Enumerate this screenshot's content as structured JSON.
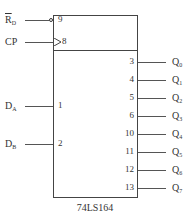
{
  "chip": {
    "name": "74LS164",
    "inputs": [
      {
        "signal": "R",
        "sub": "D",
        "overline": true,
        "pin": "9",
        "y": 20,
        "inverted": true
      },
      {
        "signal": "CP",
        "sub": "",
        "overline": false,
        "pin": "8",
        "y": 42,
        "clock": true
      },
      {
        "signal": "D",
        "sub": "A",
        "overline": false,
        "pin": "1",
        "y": 106
      },
      {
        "signal": "D",
        "sub": "B",
        "overline": false,
        "pin": "2",
        "y": 144
      }
    ],
    "outputs": [
      {
        "signal": "Q",
        "sub": "0",
        "pin": "3",
        "y": 62
      },
      {
        "signal": "Q",
        "sub": "1",
        "pin": "4",
        "y": 80
      },
      {
        "signal": "Q",
        "sub": "2",
        "pin": "5",
        "y": 98
      },
      {
        "signal": "Q",
        "sub": "3",
        "pin": "6",
        "y": 116
      },
      {
        "signal": "Q",
        "sub": "4",
        "pin": "10",
        "y": 134
      },
      {
        "signal": "Q",
        "sub": "5",
        "pin": "11",
        "y": 152
      },
      {
        "signal": "Q",
        "sub": "6",
        "pin": "12",
        "y": 170
      },
      {
        "signal": "Q",
        "sub": "7",
        "pin": "13",
        "y": 188
      }
    ]
  }
}
